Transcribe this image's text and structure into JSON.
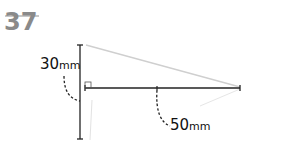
{
  "problem_number": "37",
  "labels": {
    "vertical": {
      "value": "30",
      "unit": "mm"
    },
    "horizontal": {
      "value": "50",
      "unit": "mm"
    }
  },
  "diagram": {
    "type": "right-triangle",
    "right_angle_marker": true,
    "colors": {
      "dimension_line": "#222222",
      "triangle_edge": "#cfcfcf",
      "title": "#8a8a8a"
    }
  }
}
